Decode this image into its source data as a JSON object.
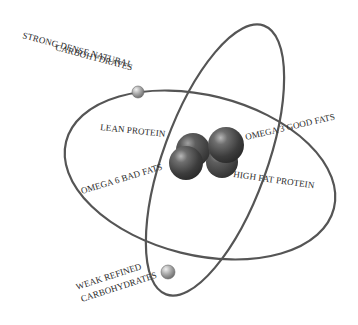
{
  "diagram": {
    "type": "atom-model",
    "labels": {
      "strong_carbs_line1": "STRONG DENSE NATURAL",
      "strong_carbs_line2": "CARBOHYDRATES",
      "weak_carbs_line1": "WEAK REFINED",
      "weak_carbs_line2": "CARBOHYDRATES",
      "lean_protein": "LEAN PROTEIN",
      "omega6": "OMEGA 6 BAD FATS",
      "omega3": "OMEGA 3 GOOD FATS",
      "high_fat_protein": "HIGH FAT PROTEIN"
    },
    "nucleus": {
      "particles": 4,
      "color": "#4a4a4a"
    },
    "electrons": [
      {
        "name": "strong-carbs-electron"
      },
      {
        "name": "weak-carbs-electron"
      }
    ],
    "orbit_color": "#555555"
  }
}
